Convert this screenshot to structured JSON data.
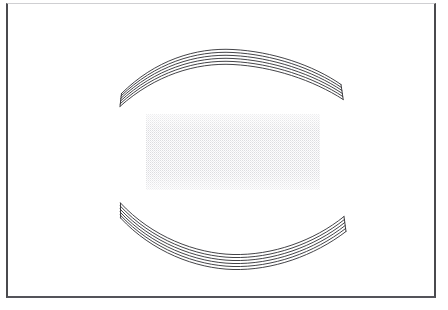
{
  "figure": {
    "kind": "technical-line-drawing",
    "background_color": "#ffffff",
    "ink_color": "#2e2e32",
    "frame": {
      "label": "figure-border",
      "x": 6,
      "y": 3,
      "width": 430,
      "height": 295,
      "side_stroke_color": "#4a4a4e",
      "top_stroke_color": "#cfcfd2",
      "bottom_stroke_color": "#54545a"
    },
    "stipple_region": {
      "label": "stippled-rectangle",
      "x": 146,
      "y": 114,
      "width": 174,
      "height": 76,
      "dot_color": "#d8d8dc",
      "fill_color": "#fdfdfd",
      "pattern": "fine-halftone-dots",
      "dot_spacing_px": 2
    },
    "upper_band": {
      "label": "upper-curved-band",
      "orientation": "arch-up",
      "strip_count": 5,
      "line_count": 6,
      "left_end_x": 120,
      "right_end_x": 342,
      "apex_y": 53,
      "end_y": 104,
      "stroke_color": "#2e2e32",
      "stroke_width": 0.9
    },
    "lower_band": {
      "label": "lower-curved-band",
      "orientation": "arch-down",
      "strip_count": 5,
      "line_count": 6,
      "left_end_x": 120,
      "right_end_x": 344,
      "apex_y": 252,
      "end_y": 202,
      "stroke_color": "#2e2e32",
      "stroke_width": 0.9
    }
  }
}
